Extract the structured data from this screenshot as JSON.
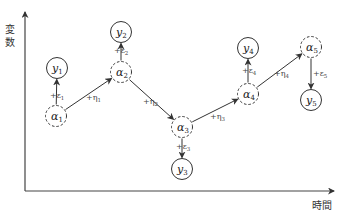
{
  "axes": {
    "y_label_chars": [
      "変",
      "数"
    ],
    "x_label": "時間",
    "origin": [
      25,
      191
    ],
    "y_top": 10,
    "x_right": 336
  },
  "colors": {
    "line": "#333333",
    "node_stroke": "#333333",
    "background": "#ffffff"
  },
  "latent_nodes": [
    {
      "id": "alpha1",
      "sym": "α",
      "sub": "1",
      "cx": 56,
      "cy": 116
    },
    {
      "id": "alpha2",
      "sym": "α",
      "sub": "2",
      "cx": 121,
      "cy": 72
    },
    {
      "id": "alpha3",
      "sym": "α",
      "sub": "3",
      "cx": 182,
      "cy": 127
    },
    {
      "id": "alpha4",
      "sym": "α",
      "sub": "4",
      "cx": 248,
      "cy": 94
    },
    {
      "id": "alpha5",
      "sym": "α",
      "sub": "5",
      "cx": 311,
      "cy": 47
    }
  ],
  "observed_nodes": [
    {
      "id": "y1",
      "sym": "y",
      "sub": "1",
      "cx": 57,
      "cy": 68
    },
    {
      "id": "y2",
      "sym": "y",
      "sub": "2",
      "cx": 121,
      "cy": 32
    },
    {
      "id": "y3",
      "sym": "y",
      "sub": "3",
      "cx": 182,
      "cy": 169
    },
    {
      "id": "y4",
      "sym": "y",
      "sub": "4",
      "cx": 248,
      "cy": 48
    },
    {
      "id": "y5",
      "sym": "y",
      "sub": "5",
      "cx": 311,
      "cy": 100
    }
  ],
  "obs_edges": [
    {
      "label": "+ε",
      "sub": "1",
      "lx": 50,
      "ly": 98
    },
    {
      "label": "+ε",
      "sub": "2",
      "lx": 114,
      "ly": 53
    },
    {
      "label": "+ε",
      "sub": "3",
      "lx": 176,
      "ly": 149
    },
    {
      "label": "+ε",
      "sub": "4",
      "lx": 242,
      "ly": 73
    },
    {
      "label": "+ε",
      "sub": "5",
      "lx": 313,
      "ly": 76
    }
  ],
  "state_edges": [
    {
      "label": "+η",
      "sub": "1",
      "lx": 86,
      "ly": 100
    },
    {
      "label": "+η",
      "sub": "2",
      "lx": 143,
      "ly": 104
    },
    {
      "label": "+η",
      "sub": "3",
      "lx": 210,
      "ly": 119
    },
    {
      "label": "+η",
      "sub": "4",
      "lx": 274,
      "ly": 76
    }
  ]
}
